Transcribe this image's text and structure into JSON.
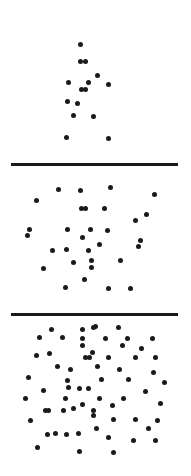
{
  "figure": {
    "title": "",
    "width": 191,
    "height": 476,
    "background_color": "#ffffff",
    "frame": {
      "x": 11,
      "y": 19,
      "width": 167,
      "height": 441,
      "border_color": "#1a1a1a",
      "border_width": 3
    },
    "dot": {
      "color": "#1a1a1a",
      "diameter": 5
    },
    "dividers": [
      {
        "y": 163,
        "thickness": 3,
        "color": "#1a1a1a"
      },
      {
        "y": 313,
        "thickness": 3,
        "color": "#1a1a1a"
      }
    ]
  },
  "chart_data": {
    "type": "scatter",
    "title": "",
    "subtitle": "",
    "xlabel": "",
    "ylabel": "",
    "grid": false,
    "legend_position": "none",
    "axis_ranges": {
      "x": [
        11,
        178
      ],
      "y": [
        19,
        460
      ]
    },
    "panel_count": 3,
    "panels": [
      {
        "name": "panel-low-density",
        "label": "Low density",
        "index": 1,
        "bounds": {
          "x": 11,
          "y": 19,
          "width": 167,
          "height": 144
        },
        "point_count": 15,
        "points": [
          [
            80,
            44
          ],
          [
            80,
            61
          ],
          [
            85,
            61
          ],
          [
            68,
            82
          ],
          [
            88,
            82
          ],
          [
            108,
            84
          ],
          [
            81,
            89
          ],
          [
            85,
            89
          ],
          [
            67,
            101
          ],
          [
            73,
            115
          ],
          [
            93,
            116
          ],
          [
            66,
            137
          ],
          [
            108,
            138
          ],
          [
            97,
            75
          ],
          [
            77,
            103
          ]
        ]
      },
      {
        "name": "panel-medium-density",
        "label": "Medium density",
        "index": 2,
        "bounds": {
          "x": 11,
          "y": 163,
          "width": 167,
          "height": 150
        },
        "point_count": 31,
        "points": [
          [
            58,
            189
          ],
          [
            80,
            190
          ],
          [
            110,
            187
          ],
          [
            154,
            194
          ],
          [
            36,
            200
          ],
          [
            81,
            208
          ],
          [
            85,
            208
          ],
          [
            104,
            208
          ],
          [
            135,
            220
          ],
          [
            29,
            229
          ],
          [
            67,
            229
          ],
          [
            90,
            229
          ],
          [
            107,
            230
          ],
          [
            82,
            237
          ],
          [
            27,
            235
          ],
          [
            138,
            246
          ],
          [
            66,
            249
          ],
          [
            88,
            250
          ],
          [
            73,
            262
          ],
          [
            91,
            260
          ],
          [
            120,
            260
          ],
          [
            43,
            268
          ],
          [
            91,
            267
          ],
          [
            84,
            279
          ],
          [
            65,
            287
          ],
          [
            108,
            288
          ],
          [
            130,
            288
          ],
          [
            146,
            214
          ],
          [
            140,
            240
          ],
          [
            52,
            250
          ],
          [
            99,
            244
          ]
        ]
      },
      {
        "name": "panel-high-density",
        "label": "High density",
        "index": 3,
        "bounds": {
          "x": 11,
          "y": 313,
          "width": 167,
          "height": 147
        },
        "point_count": 66,
        "points": [
          [
            51,
            329
          ],
          [
            82,
            329
          ],
          [
            95,
            326
          ],
          [
            93,
            327
          ],
          [
            118,
            327
          ],
          [
            62,
            337
          ],
          [
            39,
            337
          ],
          [
            82,
            338
          ],
          [
            105,
            338
          ],
          [
            127,
            338
          ],
          [
            152,
            338
          ],
          [
            49,
            353
          ],
          [
            82,
            345
          ],
          [
            92,
            352
          ],
          [
            85,
            357
          ],
          [
            89,
            357
          ],
          [
            108,
            357
          ],
          [
            135,
            357
          ],
          [
            155,
            357
          ],
          [
            28,
            377
          ],
          [
            67,
            380
          ],
          [
            70,
            369
          ],
          [
            79,
            388
          ],
          [
            88,
            388
          ],
          [
            101,
            379
          ],
          [
            119,
            369
          ],
          [
            128,
            379
          ],
          [
            153,
            372
          ],
          [
            43,
            390
          ],
          [
            68,
            387
          ],
          [
            65,
            398
          ],
          [
            45,
            410
          ],
          [
            63,
            410
          ],
          [
            73,
            408
          ],
          [
            82,
            404
          ],
          [
            30,
            420
          ],
          [
            48,
            410
          ],
          [
            93,
            415
          ],
          [
            99,
            398
          ],
          [
            123,
            398
          ],
          [
            145,
            391
          ],
          [
            112,
            405
          ],
          [
            93,
            410
          ],
          [
            113,
            419
          ],
          [
            135,
            419
          ],
          [
            157,
            420
          ],
          [
            47,
            434
          ],
          [
            55,
            433
          ],
          [
            66,
            434
          ],
          [
            78,
            433
          ],
          [
            79,
            451
          ],
          [
            108,
            437
          ],
          [
            133,
            440
          ],
          [
            155,
            440
          ],
          [
            113,
            452
          ],
          [
            36,
            355
          ],
          [
            57,
            366
          ],
          [
            97,
            366
          ],
          [
            141,
            348
          ],
          [
            164,
            382
          ],
          [
            160,
            403
          ],
          [
            25,
            398
          ],
          [
            37,
            447
          ],
          [
            96,
            428
          ],
          [
            148,
            428
          ],
          [
            122,
            345
          ]
        ]
      }
    ]
  }
}
